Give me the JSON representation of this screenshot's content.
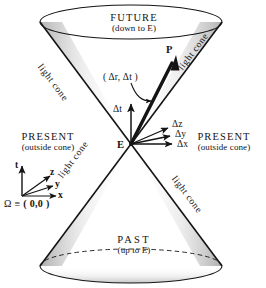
{
  "figure": {
    "colors": {
      "ink": "#141414",
      "background": "#ffffff",
      "shade": "#b9b9b9"
    }
  },
  "regions": {
    "future": {
      "title": "FUTURE",
      "subtitle": "(down to E)"
    },
    "past": {
      "title": "PAST",
      "subtitle": "(up to E)"
    },
    "present_left": {
      "title": "PRESENT",
      "subtitle": "(outside cone)"
    },
    "present_right": {
      "title": "PRESENT",
      "subtitle": "(outside cone)"
    }
  },
  "cone_labels": [
    {
      "text": "light cone",
      "position": "upper-left"
    },
    {
      "text": "light cone",
      "position": "upper-right"
    },
    {
      "text": "light cone",
      "position": "lower-left"
    },
    {
      "text": "light cone",
      "position": "lower-right"
    }
  ],
  "events": {
    "apex": "E",
    "point": "P",
    "interval_label": "( Δr, Δt )"
  },
  "vectors": [
    {
      "label": "Δt",
      "name": "delta-t"
    },
    {
      "label": "Δz",
      "name": "delta-z"
    },
    {
      "label": "Δy",
      "name": "delta-y"
    },
    {
      "label": "Δx",
      "name": "delta-x"
    }
  ],
  "axes_legend": {
    "t": "t",
    "z": "z",
    "y": "y",
    "x": "x",
    "origin_symbol": "Ω",
    "origin_relation": "≡",
    "origin_value": "( 0,0 )"
  }
}
